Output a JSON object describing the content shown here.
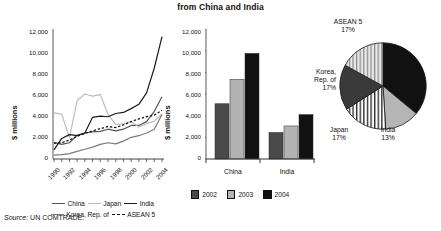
{
  "figure": {
    "title": "from China and India",
    "source_keyword": "Source:",
    "source_text": " UN COMTRADE."
  },
  "chart_data": [
    {
      "type": "line",
      "title": "",
      "xlabel": "",
      "ylabel": "$ millions",
      "ylim": [
        0,
        12000
      ],
      "yticks": [
        "0",
        "2,000",
        "4,000",
        "6,000",
        "8,000",
        "10,000",
        "12,000"
      ],
      "grid": false,
      "legend_position": "bottom",
      "x": [
        1990,
        1991,
        1992,
        1993,
        1994,
        1995,
        1996,
        1997,
        1998,
        1999,
        2000,
        2001,
        2002,
        2003,
        2004
      ],
      "xtick_labels": [
        "1990",
        "1992",
        "1994",
        "1996",
        "1998",
        "2000",
        "2002",
        "2004"
      ],
      "series": [
        {
          "name": "China",
          "color": "#555555",
          "style": "solid",
          "values": [
            1550,
            1350,
            1500,
            2200,
            2400,
            2500,
            2550,
            2750,
            2600,
            2750,
            3100,
            3100,
            3450,
            4400,
            5750
          ]
        },
        {
          "name": "Japan",
          "color": "#bdbdbd",
          "style": "solid",
          "values": [
            4250,
            4150,
            1950,
            5400,
            6000,
            5800,
            5950,
            4100,
            3200,
            3250,
            3450,
            2950,
            3250,
            3500,
            4150
          ]
        },
        {
          "name": "India",
          "color": "#1a1a1a",
          "style": "solid",
          "values": [
            850,
            1900,
            2250,
            2150,
            2400,
            3850,
            3950,
            3900,
            4200,
            4300,
            4650,
            5050,
            6100,
            8400,
            11300
          ]
        },
        {
          "name": "Korea, Rep. of",
          "color": "#7a7a7a",
          "style": "solid",
          "values": [
            350,
            400,
            500,
            700,
            900,
            1100,
            1350,
            1500,
            1400,
            1650,
            2000,
            2150,
            2400,
            2750,
            4100
          ]
        },
        {
          "name": "ASEAN 5",
          "color": "#1a1a1a",
          "style": "dashed",
          "values": [
            1450,
            1500,
            1750,
            2100,
            2350,
            2600,
            2800,
            3000,
            2900,
            3150,
            3450,
            3700,
            3900,
            4050,
            4500
          ]
        }
      ]
    },
    {
      "type": "bar",
      "title": "",
      "xlabel": "",
      "ylabel": "$ millions",
      "ylim": [
        0,
        12000
      ],
      "yticks": [
        "0",
        "2,000",
        "4,000",
        "6,000",
        "8,000",
        "10,000",
        "12,000"
      ],
      "categories": [
        "China",
        "India"
      ],
      "grid": false,
      "legend_position": "bottom",
      "series": [
        {
          "name": "2002",
          "color": "#4a4a4a",
          "values": [
            5100,
            2450
          ]
        },
        {
          "name": "2003",
          "color": "#b3b3b3",
          "values": [
            7350,
            3050
          ]
        },
        {
          "name": "2004",
          "color": "#111111",
          "values": [
            9750,
            4100
          ]
        }
      ]
    },
    {
      "type": "pie",
      "title": "",
      "labels": [
        "China",
        "India",
        "Japan",
        "Korea, Rep. of",
        "ASEAN 5"
      ],
      "values": [
        36,
        13,
        17,
        17,
        17
      ],
      "value_labels": [
        "36%",
        "13%",
        "17%",
        "17%",
        "17%"
      ],
      "colors": [
        "#111111",
        "#b5b5b5",
        "#ffffff",
        "#3a3a3a",
        "#cfcfcf"
      ],
      "patterns": [
        "solid",
        "solid",
        "vertical-stripes",
        "solid",
        "vertical-stripes"
      ],
      "legend_position": "around-slices"
    }
  ]
}
